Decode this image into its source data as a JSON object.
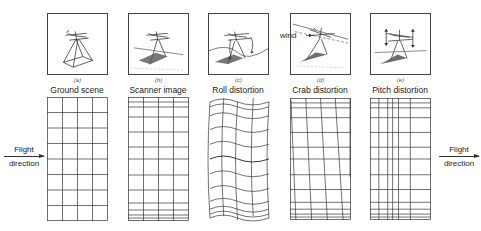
{
  "figure": {
    "panels": [
      {
        "id": "a",
        "sub_label": "(a)",
        "caption": "Ground scene",
        "x": 47
      },
      {
        "id": "b",
        "sub_label": "(b)",
        "caption": "Scanner image",
        "x": 128
      },
      {
        "id": "c",
        "sub_label": "(c)",
        "caption": "Roll distortion",
        "x": 208
      },
      {
        "id": "d",
        "sub_label": "(d)",
        "caption": "Crab distortion",
        "x": 290,
        "annotation": "wind"
      },
      {
        "id": "e",
        "sub_label": "(e)",
        "caption": "Pitch distortion",
        "x": 370
      }
    ],
    "flight_left": {
      "line1": "Flight",
      "line2": "direction"
    },
    "flight_right": {
      "line1": "Flight",
      "line2": "direction"
    }
  },
  "colors": {
    "line": "#333333",
    "shade": "#555555",
    "background": "#ffffff"
  }
}
